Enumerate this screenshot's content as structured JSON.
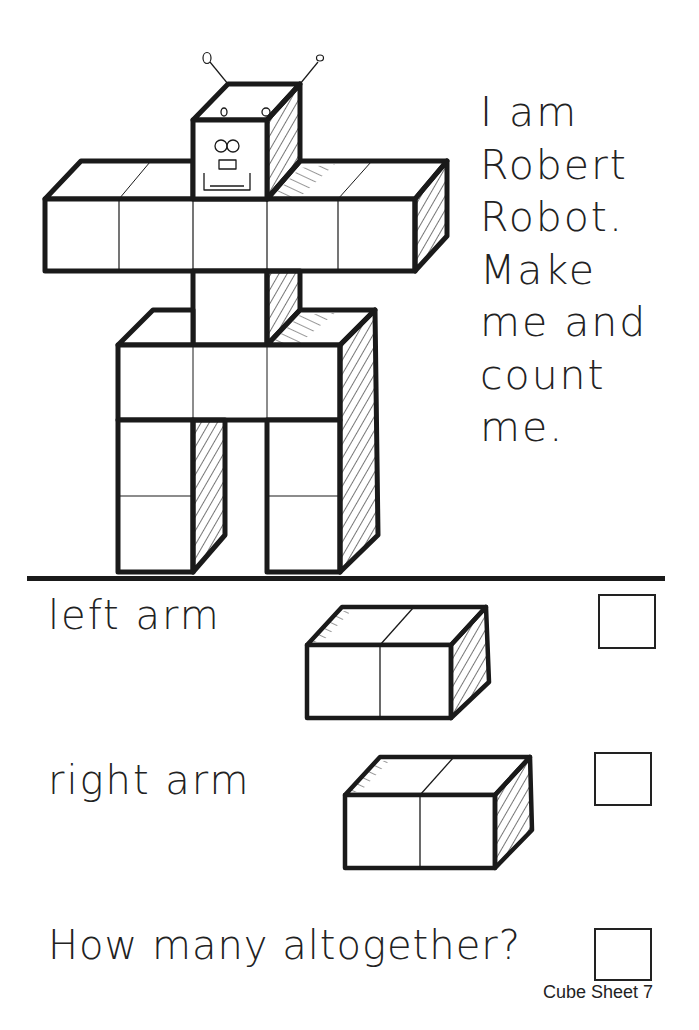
{
  "worksheet": {
    "intro_text": "I am\nRobert\nRobot.\nMake\nme and\ncount\nme.",
    "robot_name": "Robert Robot",
    "questions": [
      {
        "label": "left arm",
        "cubes": 2,
        "answer": ""
      },
      {
        "label": "right arm",
        "cubes": 2,
        "answer": ""
      },
      {
        "label": "How many altogether?",
        "answer": ""
      }
    ],
    "footer": "Cube Sheet 7"
  },
  "icons": {
    "robot_illustration": "cube-robot-drawing",
    "left_arm_illustration": "two-cube-block",
    "right_arm_illustration": "two-cube-block"
  },
  "colors": {
    "ink": "#1a1a1a",
    "paper": "#ffffff"
  }
}
